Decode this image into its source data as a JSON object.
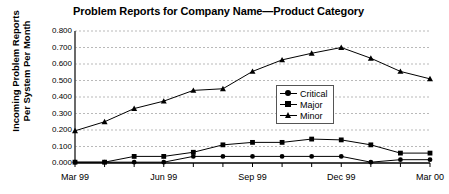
{
  "chart_data": {
    "type": "line",
    "title": "Problem Reports for Company Name—Product Category",
    "xlabel": "",
    "ylabel": "Incoming Problem Reports Per System Per Month",
    "x": [
      "Mar 99",
      "Apr 99",
      "May 99",
      "Jun 99",
      "Jul 99",
      "Aug 99",
      "Sep 99",
      "Oct 99",
      "Nov 99",
      "Dec 99",
      "Jan 00",
      "Feb 00",
      "Mar 00"
    ],
    "x_tick_labels": [
      "Mar 99",
      "Jun 99",
      "Sep 99",
      "Dec 99",
      "Mar 00"
    ],
    "x_tick_indices": [
      0,
      3,
      6,
      9,
      12
    ],
    "y_tick_labels": [
      "0.000",
      "0.100",
      "0.200",
      "0.300",
      "0.400",
      "0.500",
      "0.600",
      "0.700",
      "0.800"
    ],
    "ylim": [
      0.0,
      0.8
    ],
    "grid": true,
    "grid_style": "dashed-horizontal",
    "legend_position": "center-right-inside",
    "series": [
      {
        "name": "Critical",
        "marker": "circle",
        "values": [
          0.005,
          0.005,
          0.005,
          0.005,
          0.04,
          0.04,
          0.04,
          0.04,
          0.04,
          0.04,
          0.005,
          0.02,
          0.02
        ]
      },
      {
        "name": "Major",
        "marker": "square",
        "values": [
          0.005,
          0.005,
          0.04,
          0.04,
          0.065,
          0.11,
          0.125,
          0.125,
          0.145,
          0.14,
          0.11,
          0.06,
          0.06
        ]
      },
      {
        "name": "Minor",
        "marker": "triangle",
        "values": [
          0.195,
          0.25,
          0.33,
          0.375,
          0.44,
          0.45,
          0.555,
          0.625,
          0.665,
          0.7,
          0.635,
          0.555,
          0.51
        ]
      }
    ]
  },
  "legend": {
    "entries": [
      {
        "label": "Critical"
      },
      {
        "label": "Major"
      },
      {
        "label": "Minor"
      }
    ]
  },
  "axis_title": {
    "y": "Incoming Problem Reports Per System Per Month"
  }
}
